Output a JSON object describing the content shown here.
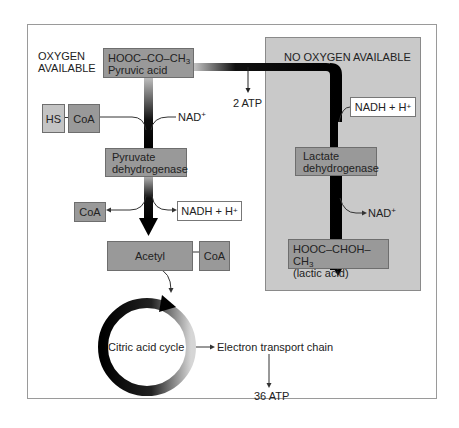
{
  "diagram": {
    "type": "metabolic-pathway"
  },
  "labels": {
    "oxygen_available_line1": "OXYGEN",
    "oxygen_available_line2": "AVAILABLE",
    "no_oxygen_available": "NO OXYGEN AVAILABLE",
    "atp_2": "2 ATP",
    "nad_plus_top": "NAD",
    "nad_plus_lactate": "NAD",
    "plus": "+",
    "electron_transport_chain": "Electron transport chain",
    "atp_36": "36 ATP",
    "citric_acid_cycle": "Citric acid cycle"
  },
  "nodes": {
    "pyruvic_acid": {
      "formula_prefix": "HOOC–CO–CH",
      "formula_sub": "3",
      "name": "Pyruvic acid"
    },
    "hs": {
      "label": "HS"
    },
    "coa_top": {
      "label": "CoA"
    },
    "pyruvate_dehydrogenase": {
      "line1": "Pyruvate",
      "line2": "dehydrogenase"
    },
    "coa_out": {
      "label": "CoA"
    },
    "nadh_left": {
      "label": "NADH + H",
      "sup": "+"
    },
    "acetyl": {
      "label": "Acetyl"
    },
    "coa_acetyl": {
      "label": "CoA"
    },
    "nadh_right": {
      "label": "NADH + H",
      "sup": "+"
    },
    "lactate_dehydrogenase": {
      "line1": "Lactate",
      "line2": "dehydrogenase"
    },
    "lactic_acid": {
      "formula_prefix": "HOOC–CHOH–CH",
      "formula_sub": "3",
      "name": "(lactic acid)"
    }
  },
  "colors": {
    "box_fill": "#999999",
    "hs_fill": "#c4c4c4",
    "panel_fill": "#c9c9c9",
    "arrow": "#111111"
  }
}
